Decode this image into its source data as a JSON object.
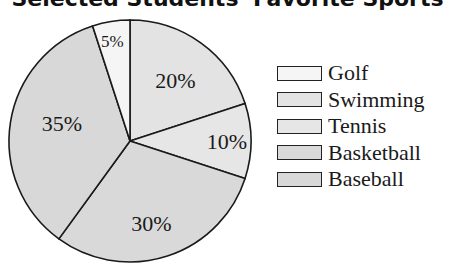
{
  "chart_data": {
    "type": "pie",
    "title": "Selected Students' Favorite Sports",
    "categories": [
      "Golf",
      "Swimming",
      "Tennis",
      "Basketball",
      "Baseball"
    ],
    "values": [
      5,
      20,
      10,
      30,
      35
    ],
    "value_labels": [
      "5%",
      "20%",
      "10%",
      "30%",
      "35%"
    ],
    "colors": [
      "#f5f5f5",
      "#e3e3e3",
      "#e6e6e6",
      "#d9d9d9",
      "#d8d8d8"
    ],
    "legend_position": "right",
    "start_angle_deg": 0,
    "direction": "clockwise",
    "slice_order_from_top": [
      "Swimming",
      "Tennis",
      "Basketball",
      "Baseball",
      "Golf"
    ]
  },
  "title": "Selected Students' Favorite Sports",
  "legend": [
    {
      "label": "Golf",
      "color": "#f5f5f5"
    },
    {
      "label": "Swimming",
      "color": "#e3e3e3"
    },
    {
      "label": "Tennis",
      "color": "#e6e6e6"
    },
    {
      "label": "Basketball",
      "color": "#d9d9d9"
    },
    {
      "label": "Baseball",
      "color": "#d8d8d8"
    }
  ]
}
